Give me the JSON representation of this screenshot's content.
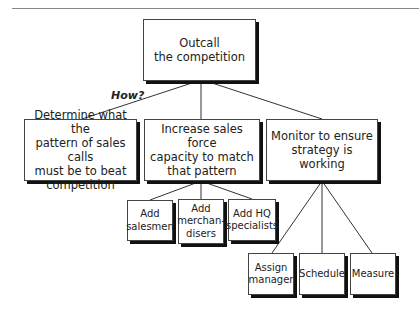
{
  "header": {
    "label": ""
  },
  "diagram": {
    "root": {
      "label": "Outcall\nthe competition",
      "lines": [
        "Outcall",
        "the competition"
      ]
    },
    "question": "How?",
    "level1": [
      {
        "lines": [
          "Determine what the",
          "pattern of sales calls",
          "must be to beat",
          "competition"
        ]
      },
      {
        "lines": [
          "Increase sales force",
          "capacity to match",
          "that pattern"
        ]
      },
      {
        "lines": [
          "Monitor to ensure",
          "strategy is working"
        ]
      }
    ],
    "level2_capacity": [
      {
        "lines": [
          "Add",
          "salesmen"
        ]
      },
      {
        "lines": [
          "Add",
          "merchan-",
          "disers"
        ]
      },
      {
        "lines": [
          "Add HQ",
          "specialists"
        ]
      }
    ],
    "level2_monitor": [
      {
        "lines": [
          "Assign",
          "manager"
        ]
      },
      {
        "lines": [
          "Schedule"
        ]
      },
      {
        "lines": [
          "Measure"
        ]
      }
    ]
  }
}
